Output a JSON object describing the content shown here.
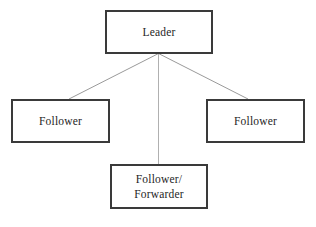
{
  "diagram": {
    "type": "hierarchy-tree",
    "background_color": "#ffffff",
    "node_border_color": "#3a3a3a",
    "node_fill_color": "#ffffff",
    "connector_color": "#9a9a9a",
    "text_color": "#1e1e1e",
    "nodes": [
      {
        "id": "leader",
        "label": "Leader",
        "role": "root"
      },
      {
        "id": "follower-left",
        "label": "Follower",
        "role": "child"
      },
      {
        "id": "follower-right",
        "label": "Follower",
        "role": "child"
      },
      {
        "id": "follower-forwarder",
        "label": "Follower/\nForwarder",
        "role": "child"
      }
    ],
    "connectors": [
      {
        "id": "leader-to-follower-left",
        "from": "leader",
        "to": "follower-left"
      },
      {
        "id": "leader-to-follower-forwarder",
        "from": "leader",
        "to": "follower-forwarder"
      },
      {
        "id": "leader-to-follower-right",
        "from": "leader",
        "to": "follower-right"
      }
    ]
  }
}
